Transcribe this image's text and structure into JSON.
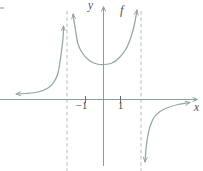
{
  "figure": {
    "labels": {
      "y_axis": "y",
      "x_axis": "x",
      "function": "f",
      "tick_neg1": "−1",
      "tick_pos1": "1"
    }
  },
  "colors": {
    "background": "#ffffff",
    "curve": "#94a4a4",
    "axis": "#8d9d9d",
    "dashed_asymptote": "#aebcbc",
    "tick": "#5f6b6b",
    "tick_label": "#3d4245",
    "letter_label": "#4c5356"
  },
  "chart_data": {
    "type": "line",
    "xlabel": "x",
    "ylabel": "y",
    "function_label": "f",
    "grid": false,
    "legend": false,
    "x_ticks": [
      -1,
      1
    ],
    "x_tick_labels": [
      "−1",
      "1"
    ],
    "xlim": [
      -5.1,
      5.0
    ],
    "ylim": [
      -4.1,
      5.4
    ],
    "vertical_asymptotes": [
      -2,
      2
    ],
    "horizontal_asymptote": 0,
    "vertical_asymptotes_px": [
      67,
      141
    ],
    "x_ticks_px": [
      85.5,
      120.5
    ],
    "series": [
      {
        "name": "left-branch",
        "behavior": "y→0+ as x→−∞; y→+∞ as x→−2−",
        "arrow_start": true,
        "arrow_end": true,
        "points": [
          [
            -5.0,
            0.31
          ],
          [
            -4.43,
            0.34
          ],
          [
            -3.74,
            0.43
          ],
          [
            -3.17,
            0.66
          ],
          [
            -2.83,
            1.0
          ],
          [
            -2.6,
            1.51
          ],
          [
            -2.43,
            2.54
          ],
          [
            -2.31,
            3.51
          ],
          [
            -2.29,
            4.2
          ]
        ],
        "points_px": [
          [
            16,
            94
          ],
          [
            26,
            93.5
          ],
          [
            38,
            92
          ],
          [
            48,
            88
          ],
          [
            54,
            82
          ],
          [
            58,
            73
          ],
          [
            61,
            55
          ],
          [
            63,
            38.5
          ],
          [
            63.5,
            26
          ]
        ]
      },
      {
        "name": "middle-branch",
        "behavior": "U-shaped; y→+∞ as x→−2+ and x→2−",
        "local_minimum": [
          0,
          2
        ],
        "arrow_start": true,
        "arrow_end": true,
        "points": [
          [
            -1.74,
            4.89
          ],
          [
            -1.6,
            3.97
          ],
          [
            -1.46,
            3.17
          ],
          [
            -1.17,
            2.6
          ],
          [
            -0.77,
            2.2
          ],
          [
            -0.37,
            2.03
          ],
          [
            0.03,
            2.0
          ],
          [
            0.49,
            2.09
          ],
          [
            0.89,
            2.37
          ],
          [
            1.29,
            2.89
          ],
          [
            1.57,
            3.57
          ],
          [
            1.77,
            4.31
          ],
          [
            1.91,
            5.11
          ]
        ],
        "points_px": [
          [
            73,
            14
          ],
          [
            75.5,
            30
          ],
          [
            78,
            44
          ],
          [
            83,
            54
          ],
          [
            90,
            61
          ],
          [
            97,
            64
          ],
          [
            104,
            64.5
          ],
          [
            112,
            63
          ],
          [
            119,
            58
          ],
          [
            126,
            49
          ],
          [
            131,
            37
          ],
          [
            134.5,
            24
          ],
          [
            137,
            10
          ]
        ]
      },
      {
        "name": "right-branch",
        "behavior": "y→−∞ as x→2+; y→0− as x→+∞",
        "arrow_start": true,
        "arrow_end": true,
        "points": [
          [
            2.37,
            -3.57
          ],
          [
            2.43,
            -2.8
          ],
          [
            2.51,
            -2.14
          ],
          [
            2.66,
            -1.51
          ],
          [
            2.89,
            -1.0
          ],
          [
            3.23,
            -0.66
          ],
          [
            3.69,
            -0.43
          ],
          [
            4.26,
            -0.26
          ],
          [
            4.94,
            -0.17
          ]
        ],
        "points_px": [
          [
            145,
            162
          ],
          [
            146,
            149
          ],
          [
            147.5,
            137.5
          ],
          [
            150,
            126.5
          ],
          [
            154,
            117.5
          ],
          [
            160,
            111.5
          ],
          [
            168,
            107.5
          ],
          [
            178,
            104.5
          ],
          [
            190,
            102.5
          ]
        ]
      }
    ]
  },
  "render": {
    "width": 203,
    "height": 171,
    "x_axis": {
      "y": 99.5,
      "x1": 0,
      "x2": 196
    },
    "y_axis": {
      "x": 103.5,
      "y1": 8,
      "y2": 166
    },
    "asymptote_top": 11,
    "asymptote_bottom": 171,
    "dash_pattern": "3.5 2.8",
    "tick_half_len": 3.5,
    "curve_width": 1.25,
    "axis_width": 1,
    "arrow_len": 5,
    "arrow_spread": 0.4
  }
}
